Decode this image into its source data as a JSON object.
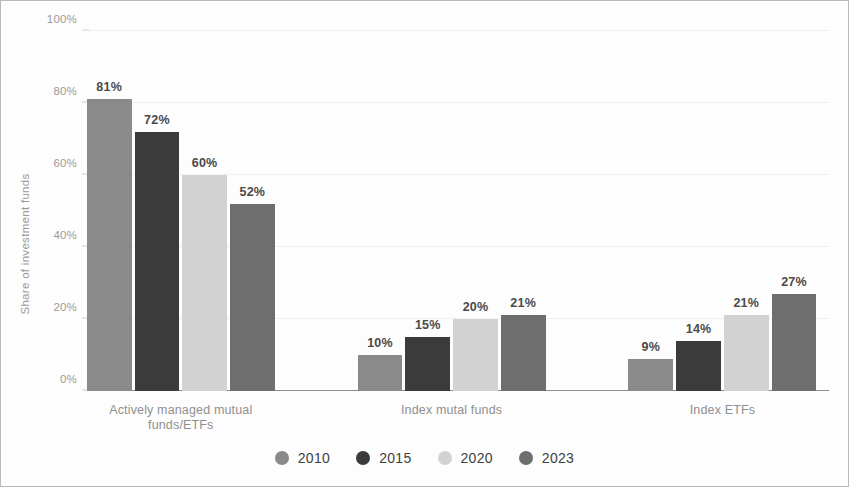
{
  "chart_data": {
    "type": "bar",
    "title": "",
    "subtitle": "",
    "xlabel": "",
    "ylabel": "Share of investment funds",
    "ylim": [
      0,
      100
    ],
    "yticks": [
      "0%",
      "20%",
      "40%",
      "60%",
      "80%",
      "100%"
    ],
    "ytick_values": [
      0,
      20,
      40,
      60,
      80,
      100
    ],
    "grid": true,
    "legend_position": "bottom",
    "value_format": "percent",
    "categories": [
      "Actively managed mutual funds/ETFs",
      "Index mutal funds",
      "Index ETFs"
    ],
    "category_lines": [
      [
        "Actively managed mutual",
        "funds/ETFs"
      ],
      [
        "Index mutal funds"
      ],
      [
        "Index ETFs"
      ]
    ],
    "series": [
      {
        "name": "2010",
        "color": "#8a8a8a",
        "values": [
          81,
          10,
          9
        ],
        "labels": [
          "81%",
          "10%",
          "9%"
        ]
      },
      {
        "name": "2015",
        "color": "#3b3b3b",
        "values": [
          72,
          15,
          14
        ],
        "labels": [
          "72%",
          "15%",
          "14%"
        ]
      },
      {
        "name": "2020",
        "color": "#d2d2d2",
        "values": [
          60,
          20,
          21
        ],
        "labels": [
          "60%",
          "20%",
          "21%"
        ]
      },
      {
        "name": "2023",
        "color": "#6e6e6e",
        "values": [
          52,
          21,
          27
        ],
        "labels": [
          "52%",
          "21%",
          "27%"
        ]
      }
    ]
  }
}
